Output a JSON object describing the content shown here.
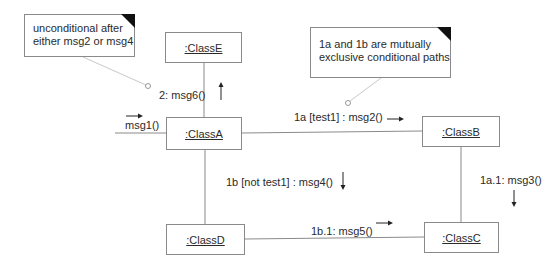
{
  "diagram": {
    "type": "UML communication diagram",
    "objects": [
      {
        "id": "classE",
        "label": ":ClassE"
      },
      {
        "id": "classA",
        "label": ":ClassA"
      },
      {
        "id": "classB",
        "label": ":ClassB"
      },
      {
        "id": "classC",
        "label": ":ClassC"
      },
      {
        "id": "classD",
        "label": ":ClassD"
      }
    ],
    "notes": [
      {
        "id": "note1",
        "lines": [
          "unconditional after",
          "either msg2 or msg4"
        ]
      },
      {
        "id": "note2",
        "lines": [
          "1a and 1b are mutually",
          "exclusive conditional paths"
        ]
      }
    ],
    "messages": [
      {
        "id": "m1",
        "label": "msg1()",
        "from": "external",
        "to": "classA",
        "arrow": "right"
      },
      {
        "id": "m2",
        "label": "1a [test1] :  msg2()",
        "from": "classA",
        "to": "classB",
        "arrow": "right"
      },
      {
        "id": "m3",
        "label": "1a.1: msg3()",
        "from": "classB",
        "to": "classC",
        "arrow": "down"
      },
      {
        "id": "m4",
        "label": "1b [not test1] : msg4()",
        "from": "classA",
        "to": "classD",
        "arrow": "down"
      },
      {
        "id": "m5",
        "label": "1b.1: msg5()",
        "from": "classD",
        "to": "classC",
        "arrow": "right"
      },
      {
        "id": "m6",
        "label": "2: msg6()",
        "from": "classA",
        "to": "classE",
        "arrow": "up"
      }
    ],
    "links": [
      [
        "classA",
        "classE"
      ],
      [
        "classA",
        "classB"
      ],
      [
        "classA",
        "classD"
      ],
      [
        "classB",
        "classC"
      ],
      [
        "classD",
        "classC"
      ]
    ]
  }
}
